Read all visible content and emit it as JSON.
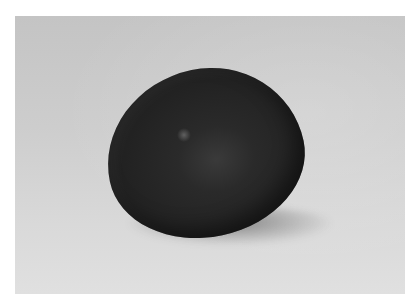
{
  "image": {
    "subject": "dark egg on light gray background",
    "colors": {
      "background_margin": "#ffffff",
      "backdrop_top": "#c4c4c4",
      "backdrop_bottom": "#e0e0e0",
      "egg": "#222222"
    }
  }
}
